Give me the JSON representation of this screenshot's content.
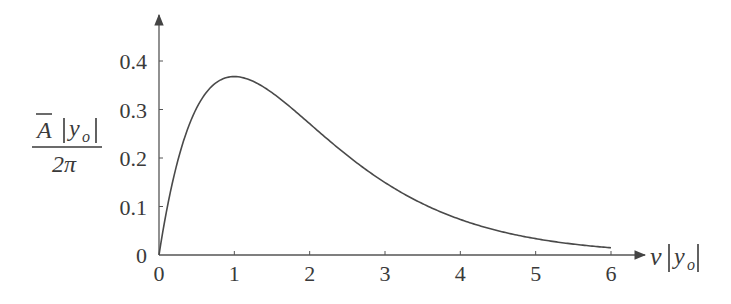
{
  "chart_data": {
    "type": "line",
    "title": "",
    "xlabel": "ν|y_o|",
    "ylabel": "Ā|y_o| / 2π",
    "ylabel_numerator": "A",
    "ylabel_numerator_var": "y",
    "ylabel_numerator_sub": "o",
    "ylabel_denominator": "2π",
    "xlabel_var": "ν",
    "xlabel_inner": "y",
    "xlabel_sub": "o",
    "xlim": [
      0,
      6
    ],
    "ylim": [
      0,
      0.4
    ],
    "xticks": [
      "0",
      "1",
      "2",
      "3",
      "4",
      "5",
      "6"
    ],
    "yticks": [
      "0",
      "0.1",
      "0.2",
      "0.3",
      "0.4"
    ],
    "grid": false,
    "legend": null,
    "series": [
      {
        "name": "x·e^(−x)",
        "x": [
          0,
          0.25,
          0.5,
          0.75,
          1,
          1.5,
          2,
          2.5,
          3,
          3.5,
          4,
          4.5,
          5,
          5.5,
          6
        ],
        "values": [
          0,
          0.195,
          0.303,
          0.354,
          0.368,
          0.335,
          0.271,
          0.205,
          0.149,
          0.106,
          0.073,
          0.05,
          0.034,
          0.022,
          0.015
        ]
      }
    ],
    "line_color": "#4a4a4a",
    "axis_color": "#555555"
  }
}
